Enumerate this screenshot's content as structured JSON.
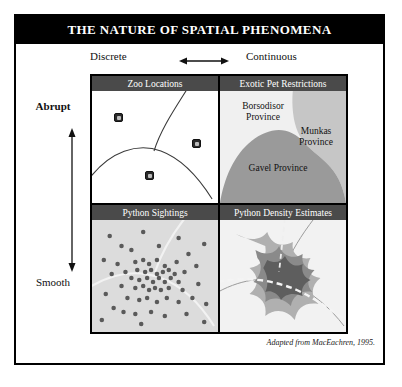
{
  "figure": {
    "title": "THE NATURE OF SPATIAL PHENOMENA",
    "attribution": "Adapted from MacEachren, 1995."
  },
  "axes": {
    "horizontal": {
      "left_label": "Discrete",
      "right_label": "Continuous",
      "arrow_icon": "double-arrow-horizontal-icon"
    },
    "vertical": {
      "top_label": "Abrupt",
      "bottom_label": "Smooth",
      "arrow_icon": "double-arrow-vertical-icon"
    }
  },
  "quadrants": [
    {
      "id": "zoo-locations",
      "header": "Zoo Locations",
      "type": "point-map",
      "description": "Discrete and abrupt: individual zoo point locations with province boundary lines",
      "background": "#ffffff",
      "marker_icon": "zoo-marker-icon",
      "markers": [
        {
          "x": 22,
          "y": 22
        },
        {
          "x": 84,
          "y": 48
        },
        {
          "x": 47,
          "y": 79
        }
      ]
    },
    {
      "id": "exotic-pet-restrictions",
      "header": "Exotic Pet Restrictions",
      "type": "choropleth-map",
      "description": "Continuous and abrupt: contiguous provinces with differing restriction levels",
      "regions": [
        {
          "name": "Borsodisor Province",
          "color": "#f0f0f0"
        },
        {
          "name": "Munkas Province",
          "color": "#c6c6c6"
        },
        {
          "name": "Gavel Province",
          "color": "#9a9a9a"
        }
      ]
    },
    {
      "id": "python-sightings",
      "header": "Python Sightings",
      "type": "dot-map",
      "description": "Discrete and smooth: individual python sighting points clustered toward the centre",
      "background": "#dcdcdc",
      "dot_color": "#5a5a5a",
      "dot_count": 62
    },
    {
      "id": "python-density-estimates",
      "header": "Python Density Estimates",
      "type": "density-surface",
      "description": "Continuous and smooth: nested density contour bands over a road network",
      "background": "#f2f2f2",
      "bands": [
        {
          "level": "low",
          "color": "#b0b0b0"
        },
        {
          "level": "medium",
          "color": "#8a8a8a"
        },
        {
          "level": "high",
          "color": "#5e5e5e"
        }
      ]
    }
  ],
  "colors": {
    "title_banner": "#000000",
    "header_bar": "#4a4a4a",
    "frame": "#000000"
  }
}
